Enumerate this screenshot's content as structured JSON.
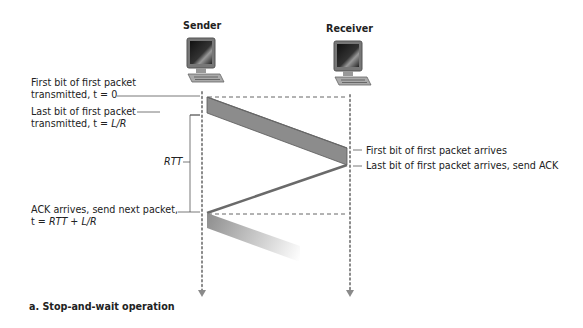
{
  "nodes": {
    "sender": {
      "label": "Sender",
      "icon": "computer-icon"
    },
    "receiver": {
      "label": "Receiver",
      "icon": "computer-icon"
    }
  },
  "annotations": {
    "first_bit_tx_line1": "First bit of first packet",
    "first_bit_tx_line2_pre": "transmitted, t = 0",
    "last_bit_tx_line1": "Last bit of first packet",
    "last_bit_tx_line2_pre": "transmitted, t = ",
    "last_bit_tx_line2_var": "L/R",
    "rtt": "RTT",
    "ack_arrives_line1": "ACK arrives, send next packet,",
    "ack_arrives_line2_pre": "t = ",
    "ack_arrives_line2_var": "RTT + L/R",
    "first_bit_arrives": "First bit of first packet arrives",
    "last_bit_arrives": "Last bit of first packet arrives, send ACK"
  },
  "caption": "a. Stop-and-wait operation",
  "colors": {
    "packet_band": "#8c8c8c",
    "packet_band_edge": "#5a5a5a",
    "timeline_dots": "#8a8a8a",
    "leader_lines": "#555555"
  }
}
